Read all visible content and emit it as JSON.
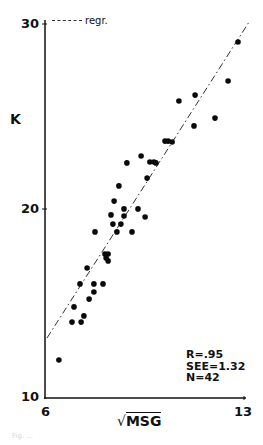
{
  "chart_data": {
    "type": "scatter",
    "title": "",
    "xlabel": "√MSG",
    "ylabel": "K",
    "xlim": [
      6,
      13
    ],
    "ylim": [
      10,
      30
    ],
    "x_ticks": [
      6,
      13
    ],
    "y_ticks": [
      10,
      20,
      30
    ],
    "grid": false,
    "legend": {
      "position": "top-left",
      "entries": [
        "regr."
      ]
    },
    "annotations": [
      "R=.95",
      "SEE=1.32",
      "N=42"
    ],
    "series": [
      {
        "name": "observations",
        "points": [
          [
            12.79,
            29.04
          ],
          [
            12.44,
            26.95
          ],
          [
            11.28,
            26.2
          ],
          [
            10.71,
            25.88
          ],
          [
            11.98,
            24.97
          ],
          [
            11.24,
            24.55
          ],
          [
            10.22,
            23.74
          ],
          [
            10.33,
            23.74
          ],
          [
            10.47,
            23.69
          ],
          [
            9.38,
            22.94
          ],
          [
            8.88,
            22.57
          ],
          [
            9.69,
            22.62
          ],
          [
            9.83,
            22.62
          ],
          [
            9.9,
            22.57
          ],
          [
            9.59,
            21.76
          ],
          [
            8.6,
            21.34
          ],
          [
            8.43,
            20.53
          ],
          [
            8.78,
            20.11
          ],
          [
            9.27,
            20.11
          ],
          [
            8.32,
            19.79
          ],
          [
            8.78,
            19.73
          ],
          [
            9.52,
            19.68
          ],
          [
            8.39,
            19.3
          ],
          [
            8.67,
            19.3
          ],
          [
            7.76,
            18.88
          ],
          [
            8.53,
            18.88
          ],
          [
            9.06,
            18.88
          ],
          [
            8.11,
            17.7
          ],
          [
            8.22,
            17.7
          ],
          [
            8.15,
            17.49
          ],
          [
            8.22,
            17.33
          ],
          [
            7.48,
            16.95
          ],
          [
            7.23,
            16.1
          ],
          [
            7.72,
            16.1
          ],
          [
            8.04,
            16.1
          ],
          [
            7.72,
            15.67
          ],
          [
            7.55,
            15.29
          ],
          [
            7.02,
            14.87
          ],
          [
            7.37,
            14.39
          ],
          [
            6.95,
            14.06
          ],
          [
            7.27,
            14.06
          ],
          [
            6.49,
            12.03
          ]
        ]
      },
      {
        "name": "regr.",
        "style": "dash-dot",
        "points": [
          [
            6.07,
            13.21
          ],
          [
            13.18,
            30.11
          ]
        ]
      }
    ]
  },
  "labels": {
    "y_axis": "K",
    "x_axis_radical": "√",
    "x_axis_text": "MSG",
    "y_ticks": [
      "30",
      "20",
      "10"
    ],
    "x_ticks": [
      "6",
      "13"
    ],
    "legend": "regr.",
    "stats": [
      "R=.95",
      "SEE=1.32",
      "N=42"
    ],
    "caption": "Fig. ..."
  }
}
